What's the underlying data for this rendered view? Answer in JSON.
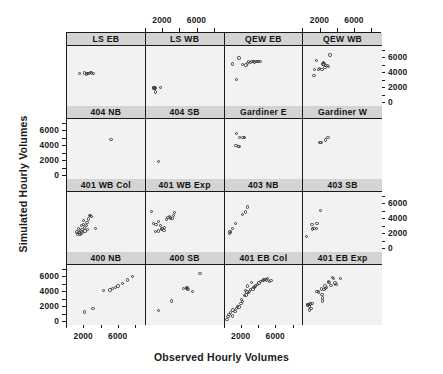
{
  "chart_data": {
    "type": "scatter",
    "title": "",
    "xlabel": "Observed Hourly Volumes",
    "ylabel": "Simulated Hourly Volumes",
    "xlim": [
      0,
      9000
    ],
    "ylim": [
      -400,
      7600
    ],
    "xticks": [
      2000,
      6000
    ],
    "yticks": [
      0,
      2000,
      4000,
      6000
    ],
    "xtick_labels": [
      "2000",
      "6000"
    ],
    "ytick_labels": [
      "0",
      "2000",
      "4000",
      "6000"
    ],
    "grid": false,
    "legend": "none",
    "layout": {
      "rows": 4,
      "cols": 4
    },
    "strip_background": "#d4d4d4",
    "panel_background": "#f2f2f2",
    "point_color": "#3a3a3a",
    "panels": [
      {
        "label": "LS EB",
        "row": 0,
        "col": 0,
        "points": [
          [
            1450,
            3900
          ],
          [
            2050,
            4000
          ],
          [
            2250,
            3850
          ],
          [
            2400,
            3900
          ],
          [
            2500,
            3950
          ],
          [
            2700,
            4050
          ],
          [
            2850,
            4000
          ],
          [
            3100,
            3950
          ]
        ]
      },
      {
        "label": "LS WB",
        "row": 0,
        "col": 1,
        "points": [
          [
            900,
            2000
          ],
          [
            950,
            2050
          ],
          [
            1000,
            1950
          ],
          [
            1050,
            2000
          ],
          [
            1100,
            1450
          ],
          [
            1700,
            2100
          ]
        ]
      },
      {
        "label": "QEW EB",
        "row": 0,
        "col": 2,
        "points": [
          [
            900,
            5200
          ],
          [
            1700,
            6000
          ],
          [
            2100,
            5100
          ],
          [
            2500,
            5050
          ],
          [
            2650,
            5300
          ],
          [
            2800,
            5500
          ],
          [
            3000,
            5400
          ],
          [
            3200,
            5500
          ],
          [
            3350,
            5550
          ],
          [
            3500,
            5450
          ],
          [
            3700,
            5500
          ],
          [
            3900,
            5500
          ],
          [
            4100,
            5550
          ],
          [
            1400,
            3100
          ]
        ]
      },
      {
        "label": "QEW WB",
        "row": 0,
        "col": 3,
        "points": [
          [
            1500,
            5700
          ],
          [
            1300,
            4500
          ],
          [
            1250,
            3700
          ],
          [
            1750,
            4500
          ],
          [
            1900,
            4600
          ],
          [
            2300,
            5200
          ],
          [
            2350,
            5400
          ],
          [
            2400,
            5200
          ],
          [
            2600,
            5000
          ],
          [
            2800,
            5000
          ],
          [
            3100,
            6400
          ],
          [
            2900,
            4900
          ],
          [
            2500,
            4700
          ],
          [
            2150,
            4500
          ]
        ]
      },
      {
        "label": "404 NB",
        "row": 1,
        "col": 0,
        "points": [
          [
            5100,
            4900
          ]
        ]
      },
      {
        "label": "404 SB",
        "row": 1,
        "col": 1,
        "points": [
          [
            1450,
            1950
          ]
        ]
      },
      {
        "label": "Gardiner E",
        "row": 1,
        "col": 2,
        "points": [
          [
            1400,
            5700
          ],
          [
            1750,
            5100
          ],
          [
            2150,
            5100
          ],
          [
            2300,
            5100
          ],
          [
            1350,
            4100
          ],
          [
            1600,
            3950
          ],
          [
            1680,
            3900
          ]
        ]
      },
      {
        "label": "Gardiner W",
        "row": 1,
        "col": 3,
        "points": [
          [
            1950,
            4450
          ],
          [
            2050,
            4450
          ],
          [
            2600,
            4800
          ],
          [
            2850,
            5150
          ]
        ]
      },
      {
        "label": "401 WB Col",
        "row": 2,
        "col": 0,
        "points": [
          [
            1150,
            2250
          ],
          [
            1250,
            2000
          ],
          [
            1350,
            2750
          ],
          [
            1400,
            2200
          ],
          [
            1500,
            1900
          ],
          [
            1550,
            2450
          ],
          [
            1600,
            2050
          ],
          [
            1700,
            3150
          ],
          [
            1750,
            2600
          ],
          [
            1800,
            2200
          ],
          [
            1900,
            3250
          ],
          [
            2000,
            2900
          ],
          [
            2100,
            2400
          ],
          [
            2250,
            3150
          ],
          [
            2300,
            3500
          ],
          [
            2400,
            2600
          ],
          [
            2500,
            4000
          ],
          [
            2600,
            4500
          ],
          [
            2750,
            4500
          ],
          [
            2850,
            4350
          ],
          [
            3300,
            2750
          ],
          [
            1900,
            3800
          ]
        ]
      },
      {
        "label": "401 WB Exp",
        "row": 2,
        "col": 1,
        "points": [
          [
            700,
            5000
          ],
          [
            900,
            3400
          ],
          [
            1200,
            3300
          ],
          [
            1450,
            3700
          ],
          [
            1500,
            2400
          ],
          [
            1700,
            3100
          ],
          [
            1800,
            2600
          ],
          [
            1900,
            2700
          ],
          [
            2100,
            2500
          ],
          [
            2400,
            3900
          ],
          [
            2600,
            4200
          ],
          [
            2750,
            4300
          ],
          [
            2900,
            4150
          ],
          [
            3050,
            4100
          ],
          [
            3200,
            4500
          ],
          [
            3350,
            4900
          ],
          [
            2200,
            2900
          ],
          [
            1100,
            2350
          ]
        ]
      },
      {
        "label": "403 NB",
        "row": 2,
        "col": 2,
        "points": [
          [
            600,
            2100
          ],
          [
            650,
            2350
          ],
          [
            700,
            2200
          ],
          [
            900,
            2700
          ],
          [
            1300,
            3400
          ],
          [
            2100,
            4600
          ],
          [
            2700,
            5600
          ],
          [
            2400,
            4950
          ]
        ]
      },
      {
        "label": "403 SB",
        "row": 2,
        "col": 3,
        "points": [
          [
            400,
            1650
          ],
          [
            1000,
            3250
          ],
          [
            1100,
            2650
          ],
          [
            1250,
            2750
          ],
          [
            1550,
            2700
          ],
          [
            1600,
            3400
          ],
          [
            2000,
            5100
          ]
        ]
      },
      {
        "label": "400 NB",
        "row": 3,
        "col": 0,
        "points": [
          [
            2000,
            1350
          ],
          [
            3000,
            1800
          ],
          [
            4200,
            4200
          ],
          [
            5000,
            4250
          ],
          [
            5300,
            4500
          ],
          [
            5600,
            4600
          ],
          [
            5900,
            4800
          ],
          [
            6400,
            5100
          ],
          [
            7000,
            5600
          ],
          [
            7600,
            6100
          ]
        ]
      },
      {
        "label": "400 SB",
        "row": 3,
        "col": 1,
        "points": [
          [
            1500,
            1550
          ],
          [
            3000,
            2800
          ],
          [
            4400,
            4450
          ],
          [
            4700,
            4500
          ],
          [
            4800,
            4600
          ],
          [
            4850,
            4500
          ],
          [
            4900,
            4350
          ],
          [
            5400,
            4050
          ],
          [
            6300,
            6500
          ]
        ]
      },
      {
        "label": "401 EB Col",
        "row": 3,
        "col": 2,
        "points": [
          [
            300,
            300
          ],
          [
            400,
            700
          ],
          [
            500,
            1000
          ],
          [
            700,
            1300
          ],
          [
            900,
            800
          ],
          [
            1000,
            1600
          ],
          [
            1200,
            1400
          ],
          [
            1400,
            1800
          ],
          [
            1500,
            2100
          ],
          [
            1700,
            2000
          ],
          [
            1900,
            2500
          ],
          [
            2000,
            3000
          ],
          [
            2100,
            2700
          ],
          [
            2300,
            3500
          ],
          [
            2400,
            4200
          ],
          [
            2500,
            3600
          ],
          [
            2600,
            4000
          ],
          [
            2800,
            3900
          ],
          [
            2900,
            4100
          ],
          [
            3000,
            4300
          ],
          [
            3100,
            5300
          ],
          [
            3300,
            4400
          ],
          [
            3400,
            4600
          ],
          [
            3500,
            4700
          ],
          [
            3600,
            4800
          ],
          [
            3800,
            5000
          ],
          [
            4000,
            5200
          ],
          [
            4200,
            5400
          ],
          [
            4400,
            5500
          ],
          [
            4500,
            5600
          ],
          [
            4700,
            5700
          ],
          [
            4900,
            5600
          ],
          [
            5000,
            5800
          ],
          [
            5200,
            5400
          ],
          [
            5400,
            5500
          ],
          [
            2700,
            4800
          ]
        ]
      },
      {
        "label": "401 EB Exp",
        "row": 3,
        "col": 3,
        "points": [
          [
            500,
            2250
          ],
          [
            550,
            2350
          ],
          [
            620,
            2300
          ],
          [
            700,
            2150
          ],
          [
            750,
            1600
          ],
          [
            800,
            2400
          ],
          [
            900,
            1800
          ],
          [
            1000,
            2500
          ],
          [
            1600,
            4100
          ],
          [
            1800,
            4000
          ],
          [
            2100,
            4400
          ],
          [
            2150,
            3700
          ],
          [
            2200,
            3200
          ],
          [
            2250,
            2800
          ],
          [
            2500,
            4800
          ],
          [
            2700,
            4600
          ],
          [
            2900,
            5400
          ],
          [
            3000,
            5300
          ],
          [
            3200,
            4900
          ],
          [
            3400,
            5900
          ],
          [
            3500,
            5800
          ],
          [
            3700,
            5200
          ],
          [
            3800,
            5000
          ],
          [
            4300,
            5800
          ],
          [
            2400,
            4300
          ],
          [
            2600,
            4500
          ]
        ]
      }
    ]
  }
}
